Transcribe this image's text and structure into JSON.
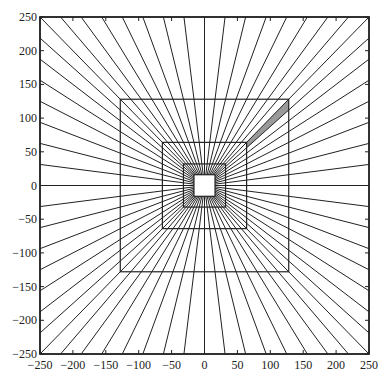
{
  "chart_data": {
    "type": "diagram",
    "title": "",
    "xlabel": "",
    "ylabel": "",
    "xlim": [
      -250,
      250
    ],
    "ylim": [
      -250,
      250
    ],
    "x_ticks": [
      -250,
      -200,
      -150,
      -100,
      -50,
      0,
      50,
      100,
      150,
      200,
      250
    ],
    "y_ticks": [
      -250,
      -200,
      -150,
      -100,
      -50,
      0,
      50,
      100,
      150,
      200,
      250
    ],
    "x_tick_labels": [
      "−250",
      "−200",
      "−150",
      "−100",
      "−50",
      "0",
      "50",
      "100",
      "150",
      "200",
      "250"
    ],
    "y_tick_labels": [
      "−250",
      "−200",
      "−150",
      "−100",
      "−50",
      "0",
      "50",
      "100",
      "150",
      "200",
      "250"
    ],
    "concentric_squares_halfwidth": [
      16,
      32,
      64,
      128,
      250
    ],
    "rays_per_edge_divisions": 16,
    "ray_inner_halfwidth": 16,
    "ray_outer_halfwidth": 250,
    "shaded_cell": {
      "between_squares": [
        64,
        128
      ],
      "ray_endpoints_outer": [
        [
          250,
          250
        ],
        [
          250,
          218.75
        ]
      ],
      "fill": "#9a9a9a"
    },
    "line_color": "#222222",
    "grid": false
  }
}
